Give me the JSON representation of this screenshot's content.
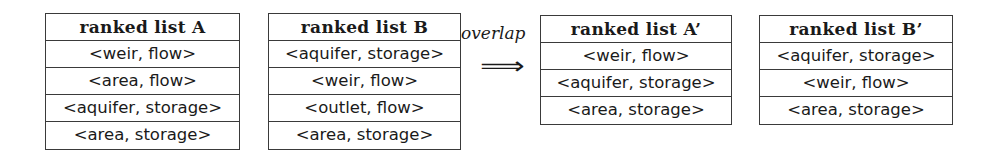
{
  "tables": {
    "a": {
      "title": "ranked list A",
      "rows": [
        "<weir, flow>",
        "<area, flow>",
        "<aquifer, storage>",
        "<area, storage>"
      ]
    },
    "b": {
      "title": "ranked list B",
      "rows": [
        "<aquifer, storage>",
        "<weir, flow>",
        "<outlet, flow>",
        "<area, storage>"
      ]
    },
    "a_prime": {
      "title": "ranked list A’",
      "rows": [
        "<weir, flow>",
        "<aquifer, storage>",
        "<area, storage>"
      ]
    },
    "b_prime": {
      "title": "ranked list B’",
      "rows": [
        "<aquifer, storage>",
        "<weir, flow>",
        "<area, storage>"
      ]
    }
  },
  "transition": {
    "label": "overlap",
    "arrow": "⟹",
    "arrow_icon": "double-right-arrow-icon"
  }
}
